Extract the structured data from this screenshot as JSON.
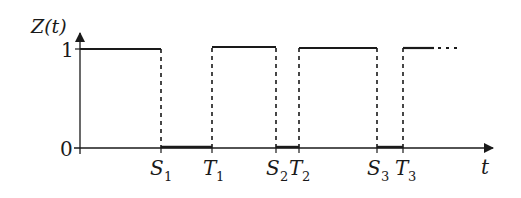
{
  "diagram": {
    "type": "step-function",
    "y_axis_label": "Z(t)",
    "x_axis_label": "t",
    "y_ticks": [
      {
        "label": "1",
        "value": 1
      },
      {
        "label": "0",
        "value": 0
      }
    ],
    "x_ticks": [
      {
        "label": "S",
        "sub": "1"
      },
      {
        "label": "T",
        "sub": "1"
      },
      {
        "label": "S",
        "sub": "2"
      },
      {
        "label": "T",
        "sub": "2"
      },
      {
        "label": "S",
        "sub": "3"
      },
      {
        "label": "T",
        "sub": "3"
      }
    ],
    "segments": [
      {
        "from": "0",
        "to": "S1",
        "level": 1
      },
      {
        "from": "S1",
        "to": "T1",
        "level": 0
      },
      {
        "from": "T1",
        "to": "S2",
        "level": 1
      },
      {
        "from": "S2",
        "to": "T2",
        "level": 0
      },
      {
        "from": "T2",
        "to": "S3",
        "level": 1
      },
      {
        "from": "S3",
        "to": "T3",
        "level": 0
      },
      {
        "from": "T3",
        "to": "...",
        "level": 1,
        "continues": true
      }
    ],
    "colors": {
      "ink": "#1a1a1a",
      "background": "#ffffff"
    }
  }
}
